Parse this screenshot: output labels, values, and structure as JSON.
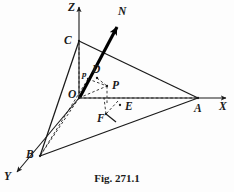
{
  "figure": {
    "caption": "Fig. 271.1",
    "colors": {
      "background": "#fdfdfd",
      "stroke": "#1a1a1a",
      "label": "#1a1a1a",
      "normal_vector": "#000000"
    },
    "axes": [
      {
        "name": "z-axis",
        "label": "Z",
        "label_x": 68,
        "label_y": 11,
        "x1": 79,
        "y1": 98,
        "x2": 79,
        "y2": 7
      },
      {
        "name": "x-axis",
        "label": "X",
        "label_x": 219,
        "label_y": 110,
        "x1": 79,
        "y1": 98,
        "x2": 226,
        "y2": 98
      },
      {
        "name": "y-axis",
        "label": "Y",
        "label_x": 4,
        "label_y": 180,
        "x1": 79,
        "y1": 98,
        "x2": 17,
        "y2": 172
      }
    ],
    "points": [
      {
        "name": "O",
        "label": "O",
        "label_x": 68,
        "label_y": 98,
        "px": 79,
        "py": 98,
        "size": "lg"
      },
      {
        "name": "A",
        "label": "A",
        "label_x": 194,
        "label_y": 112,
        "px": 198,
        "py": 98,
        "size": "lg"
      },
      {
        "name": "B",
        "label": "B",
        "label_x": 26,
        "label_y": 158,
        "px": 40,
        "py": 156,
        "size": "lg"
      },
      {
        "name": "C",
        "label": "C",
        "label_x": 64,
        "label_y": 44,
        "px": 79,
        "py": 41,
        "size": "lg"
      },
      {
        "name": "D",
        "label": "D",
        "label_x": 92,
        "label_y": 73,
        "px": 97,
        "py": 78,
        "size": "lg"
      },
      {
        "name": "E",
        "label": "E",
        "label_x": 125,
        "label_y": 110,
        "px": 120,
        "py": 105,
        "size": "lg"
      },
      {
        "name": "F",
        "label": "F",
        "label_x": 97,
        "label_y": 122,
        "px": 106,
        "py": 114,
        "size": "lg"
      },
      {
        "name": "P",
        "label": "P",
        "label_x": 112,
        "label_y": 89,
        "px": 107,
        "py": 86,
        "size": "lg"
      },
      {
        "name": "p",
        "label": "p",
        "label_x": 82,
        "label_y": 77,
        "px": 88,
        "py": 79,
        "size": "sm"
      },
      {
        "name": "N",
        "label": "N",
        "label_x": 118,
        "label_y": 15,
        "px": 117,
        "py": 27,
        "size": "lg"
      }
    ],
    "solid_edges": [
      {
        "name": "edge-C-A",
        "x1": 79,
        "y1": 41,
        "x2": 198,
        "y2": 98
      },
      {
        "name": "edge-C-B",
        "x1": 79,
        "y1": 41,
        "x2": 40,
        "y2": 156
      },
      {
        "name": "edge-B-A",
        "x1": 40,
        "y1": 156,
        "x2": 198,
        "y2": 98
      },
      {
        "name": "edge-F-plane",
        "x1": 106,
        "y1": 114,
        "x2": 116,
        "y2": 122
      }
    ],
    "dashed_edges": [
      {
        "name": "dash-O-C",
        "x1": 79,
        "y1": 98,
        "x2": 79,
        "y2": 41
      },
      {
        "name": "dash-O-A",
        "x1": 79,
        "y1": 98,
        "x2": 198,
        "y2": 98
      },
      {
        "name": "dash-O-B",
        "x1": 79,
        "y1": 98,
        "x2": 40,
        "y2": 156
      },
      {
        "name": "dash-O-P",
        "x1": 79,
        "y1": 98,
        "x2": 107,
        "y2": 86
      },
      {
        "name": "dash-p-B",
        "x1": 88,
        "y1": 79,
        "x2": 40,
        "y2": 156
      },
      {
        "name": "dash-p-P",
        "x1": 88,
        "y1": 79,
        "x2": 107,
        "y2": 86
      },
      {
        "name": "dash-D-P",
        "x1": 97,
        "y1": 78,
        "x2": 107,
        "y2": 86
      },
      {
        "name": "dash-P-E",
        "x1": 107,
        "y1": 86,
        "x2": 107,
        "y2": 104
      },
      {
        "name": "dash-E-F",
        "x1": 118,
        "y1": 101,
        "x2": 106,
        "y2": 114
      },
      {
        "name": "dash-F-vert",
        "x1": 106,
        "y1": 114,
        "x2": 104,
        "y2": 98
      }
    ],
    "normal_arrow": {
      "name": "normal-vector-N",
      "label": "N",
      "x1": 80,
      "y1": 97,
      "x2": 117,
      "y2": 27
    }
  }
}
